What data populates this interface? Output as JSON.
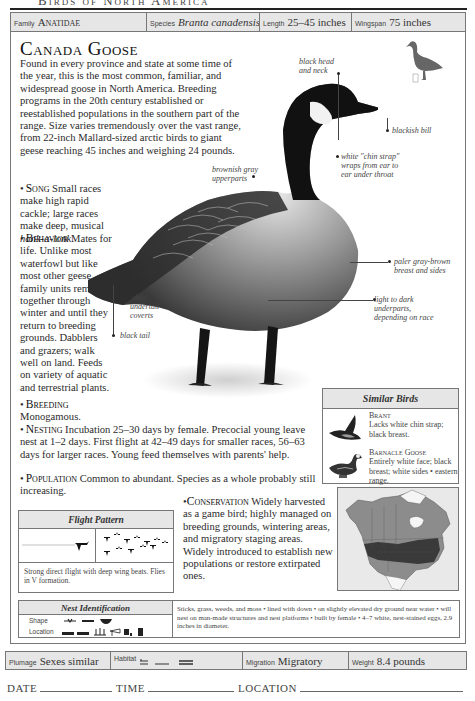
{
  "header": {
    "running_head": "Birds of North America",
    "family_label": "Family",
    "family_value": "Anatidae",
    "species_label": "Species",
    "species_value": "Branta canadensis",
    "length_label": "Length",
    "length_value": "25–45 inches",
    "wingspan_label": "Wingspan",
    "wingspan_value": "75 inches"
  },
  "title": "Canada Goose",
  "intro": "Found in every province and state at some time of the year, this is the most common, familiar, and widespread goose in North America. Breeding programs in the 20th century established or reestablished populations in the southern part of the range. Size varies tremendously over the vast range, from 22-inch Mallard-sized arctic birds to giant geese reaching 45 inches and weighing 24 pounds.",
  "sections": {
    "song": {
      "bullet": "•",
      "head": "Song",
      "text": " Small races make high rapid cackle; large races make deep, musical ",
      "italic": "honk-a-lonk",
      "end": "."
    },
    "behavior": {
      "bullet": "•",
      "head": "Behavior",
      "text": " Mates for life. Unlike most waterfowl but like most other geese, family units remain together through winter and until they return to breeding grounds. Dabblers and grazers; walk well on land. Feeds on variety of aquatic and terrestrial plants."
    },
    "breeding": {
      "bullet": "•",
      "head": "Breeding",
      "text": "Monogamous."
    },
    "nesting": {
      "bullet": "•",
      "head": "Nesting",
      "text": " Incubation 25–30 days by female. Precocial young leave nest at 1–2 days. First flight at 42–49 days for smaller races, 56–63 days for larger races. Young feed themselves with parents' help."
    },
    "population": {
      "bullet": "•",
      "head": "Population",
      "text": " Common to abundant. Species as a whole probably still increasing."
    },
    "conservation": {
      "bullet": "•",
      "head": "Conservation",
      "text": " Widely harvested as a game bird; highly managed on breeding grounds, wintering areas, and migratory staging areas. Widely introduced to establish new populations or restore extirpated ones."
    }
  },
  "callouts": {
    "head": "black head\nand neck",
    "bill": "blackish bill",
    "chin": "white \"chin strap\"\nwraps from ear to\near under throat",
    "upperparts": "brownish gray\nupperparts",
    "breast": "paler gray-brown\nbreast and sides",
    "underparts": "light to dark\nunderparts,\ndepending on race",
    "undertail": "white\nundertail\ncoverts",
    "tail": "black tail"
  },
  "similar_birds": {
    "title": "Similar Birds",
    "items": [
      {
        "name": "Brant",
        "desc": "Lacks white chin strap; black breast."
      },
      {
        "name": "Barnacle Goose",
        "desc": "Entirely white face; black breast; white sides • eastern range."
      }
    ]
  },
  "flight_pattern": {
    "title": "Flight Pattern",
    "desc": "Strong direct flight with deep wing beats. Flies in V formation."
  },
  "nest_identification": {
    "title": "Nest Identification",
    "shape_label": "Shape",
    "location_label": "Location",
    "desc": "Sticks, grass, weeds, and moss • lined with down • on slightly elevated dry ground near water • will nest on man-made structures and nest platforms • built by female • 4–7 white, nest-stained eggs, 2.9 inches in diameter."
  },
  "footer": {
    "plumage_label": "Plumage",
    "plumage_value": "Sexes similar",
    "habitat_label": "Habitat",
    "migration_label": "Migration",
    "migration_value": "Migratory",
    "weight_label": "Weight",
    "weight_value": "8.4 pounds"
  },
  "log": {
    "date_label": "DATE",
    "time_label": "TIME",
    "location_label": "LOCATION"
  },
  "colors": {
    "bar_fill": "#e6e6e6",
    "border": "#777777",
    "map_range_dark": "#3a3a3a",
    "map_range_mid": "#8a8a8a"
  }
}
